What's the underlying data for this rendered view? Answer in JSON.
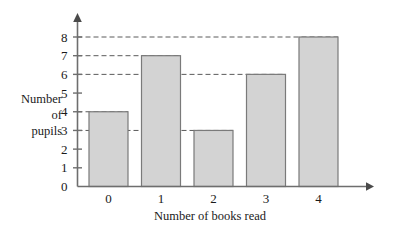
{
  "chart_data": {
    "type": "bar",
    "title": "",
    "xlabel": "Number of books read",
    "ylabel": "Number of pupils",
    "ylabel_lines": [
      "Number",
      "of",
      "pupils"
    ],
    "categories": [
      "0",
      "1",
      "2",
      "3",
      "4"
    ],
    "values": [
      4,
      7,
      3,
      6,
      8
    ],
    "ytick_labels": [
      "0",
      "1",
      "2",
      "3",
      "4",
      "5",
      "6",
      "7",
      "8"
    ],
    "ytick_values": [
      0,
      1,
      2,
      3,
      4,
      5,
      6,
      7,
      8
    ],
    "ylim": [
      0,
      8
    ],
    "grid": true,
    "gridline_style": "dashed",
    "gridline_values": [
      3,
      4,
      6,
      7,
      8
    ],
    "legend": "none",
    "bar_fill_color": "#d3d3d3",
    "bar_border_color": "#7a7a7a",
    "axis_color": "#6e6e6e",
    "gridline_color": "#5a5a5a",
    "background_color": "#ffffff"
  }
}
